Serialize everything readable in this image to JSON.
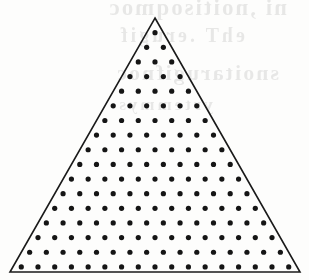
{
  "figure": {
    "background_color": "#fdfdfc",
    "outline_color": "#1a1a1a",
    "dot_color": "#151515",
    "outline_width": 1.6,
    "dot_radius": 2.6
  },
  "triangle": {
    "apex": {
      "x": 155,
      "y": 18
    },
    "base_left": {
      "x": 10,
      "y": 272
    },
    "base_right": {
      "x": 300,
      "y": 272
    },
    "base_width": 290,
    "height": 254
  },
  "lattice": {
    "type": "triangular",
    "rows": 17,
    "dots_in_row_rule": "row n (1-indexed from apex) contains n dots",
    "total_dots": 153,
    "row_spacing": 14.35,
    "column_spacing": 16.1,
    "first_row_offset_y": 16,
    "inset_from_apex": 2
  },
  "bleed_through": {
    "visible": true,
    "description": "faint mirrored show-through text from the reverse side of the scanned page",
    "lines": [
      "ni ,noitisoqmoc",
      "ehT .erugif",
      "snoitarugifnoc",
      "yrtemmys"
    ]
  }
}
